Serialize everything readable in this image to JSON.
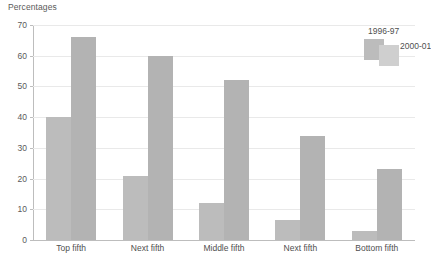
{
  "chart_data": {
    "type": "bar",
    "title": "Percentages",
    "xlabel": "",
    "ylabel": "Percentages",
    "ylim": [
      0,
      70
    ],
    "ytick_step": 10,
    "yticks": [
      "70",
      "60",
      "50",
      "40",
      "30",
      "20",
      "10",
      "0"
    ],
    "grid": true,
    "legend_position": "top-right",
    "categories": [
      "Top fifth",
      "Next fifth",
      "Middle fifth",
      "Next fifth",
      "Bottom fifth"
    ],
    "series": [
      {
        "name": "1996-97",
        "color": "#bcbcbc",
        "values": [
          40,
          21,
          12,
          6.5,
          3
        ]
      },
      {
        "name": "2000-01",
        "color": "#b3b3b3",
        "values": [
          66,
          60,
          52,
          34,
          23
        ]
      }
    ]
  },
  "axis_title": "Percentages",
  "legend": {
    "entries": [
      {
        "label": "1996-97"
      },
      {
        "label": "2000-01"
      }
    ]
  }
}
